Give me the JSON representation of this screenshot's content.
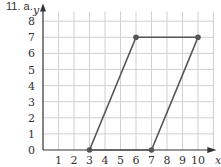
{
  "problem_label": "11. a.",
  "chart_data": {
    "type": "line",
    "title": "",
    "xlabel": "x",
    "ylabel": "y",
    "xlim": [
      0,
      10
    ],
    "ylim": [
      0,
      8
    ],
    "x_ticks": [
      1,
      2,
      3,
      4,
      5,
      6,
      7,
      8,
      9,
      10
    ],
    "y_ticks": [
      0,
      1,
      2,
      3,
      4,
      5,
      6,
      7,
      8
    ],
    "grid": true,
    "series": [
      {
        "name": "parallelogram",
        "points": [
          [
            3,
            0
          ],
          [
            6,
            7
          ],
          [
            10,
            7
          ],
          [
            7,
            0
          ]
        ],
        "closed": true
      }
    ],
    "colors": {
      "shape": "#555555",
      "grid": "#d0d0d0",
      "axis": "#333333"
    }
  }
}
